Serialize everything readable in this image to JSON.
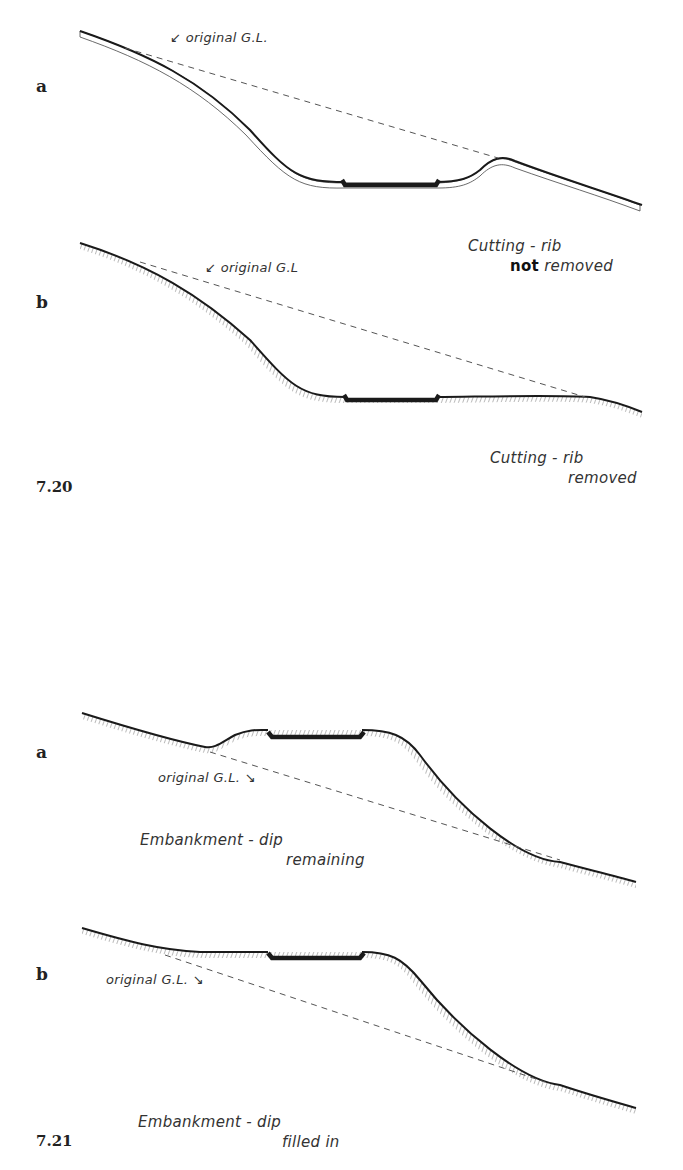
{
  "figures": [
    {
      "number": "7.20",
      "panels": [
        {
          "letter": "a",
          "annotation": "original G.L.",
          "caption_line1": "Cutting - rib",
          "caption_bold": "not",
          "caption_line2": "removed"
        },
        {
          "letter": "b",
          "annotation": "original G.L",
          "caption_line1": "Cutting - rib",
          "caption_line2": "removed"
        }
      ]
    },
    {
      "number": "7.21",
      "panels": [
        {
          "letter": "a",
          "annotation": "original G.L.",
          "caption_line1": "Embankment - dip",
          "caption_line2": "remaining"
        },
        {
          "letter": "b",
          "annotation": "original G.L.",
          "caption_line1": "Embankment - dip",
          "caption_line2": "filled in"
        }
      ]
    }
  ],
  "colors": {
    "ink": "#1a1a1a",
    "dashed": "#555555",
    "background": "#ffffff"
  }
}
